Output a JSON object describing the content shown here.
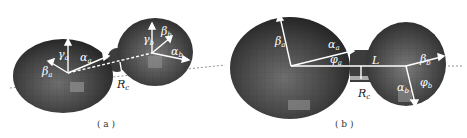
{
  "figure": {
    "panels": [
      {
        "id": "a",
        "caption": "( a )",
        "description": "3D view of two connected ellipsoidal lobes (mesh) with semi-axis vectors",
        "labels": {
          "gamma_a": "γa",
          "alpha_a": "αa",
          "beta_a": "βa",
          "gamma_b": "γb",
          "beta_b": "βb",
          "alpha_b": "αb",
          "neck_radius": "Rc"
        }
      },
      {
        "id": "b",
        "caption": "( b )",
        "description": "Top view of two lobes connected by a neck of length L and radius Rc",
        "labels": {
          "beta_a": "βa",
          "alpha_a": "αa",
          "phi_a": "φa",
          "length": "L",
          "neck_radius": "Rc",
          "beta_b": "βb",
          "phi_b": "φb",
          "alpha_b": "αb"
        }
      }
    ],
    "colors": {
      "body_dark": "#3a3a3a",
      "body_mid": "#5a5a5a",
      "highlight": "#8a8a8a",
      "vector": "#ffffff",
      "axis_dash": "#555555"
    }
  }
}
